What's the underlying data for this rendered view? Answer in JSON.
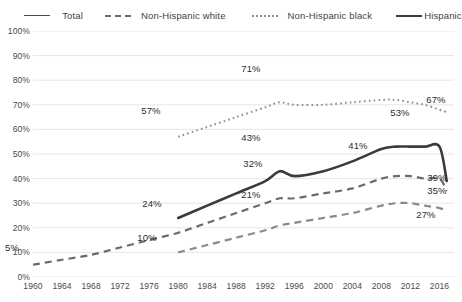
{
  "legend": {
    "items": [
      {
        "label": "Total",
        "style": "solid-thin",
        "icon": "line-solid-thin-icon"
      },
      {
        "label": "Non-Hispanic white",
        "style": "dashed",
        "icon": "line-dashed-icon"
      },
      {
        "label": "Non-Hispanic black",
        "style": "dotted",
        "icon": "line-dotted-icon"
      },
      {
        "label": "Hispanic",
        "style": "solid-thick",
        "icon": "line-solid-thick-icon"
      }
    ]
  },
  "chart_data": {
    "type": "line",
    "title": "",
    "xlabel": "",
    "ylabel": "",
    "xlim": [
      1960,
      2018
    ],
    "ylim": [
      0,
      100
    ],
    "grid": true,
    "legend_position": "top",
    "y_ticks": [
      "0%",
      "10%",
      "20%",
      "30%",
      "40%",
      "50%",
      "60%",
      "70%",
      "80%",
      "90%",
      "100%"
    ],
    "y_tick_values": [
      0,
      10,
      20,
      30,
      40,
      50,
      60,
      70,
      80,
      90,
      100
    ],
    "x_ticks": [
      "1960",
      "1964",
      "1968",
      "1972",
      "1976",
      "1980",
      "1984",
      "1988",
      "1992",
      "1996",
      "2000",
      "2004",
      "2008",
      "2012",
      "2016"
    ],
    "x_tick_values": [
      1960,
      1964,
      1968,
      1972,
      1976,
      1980,
      1984,
      1988,
      1992,
      1996,
      2000,
      2004,
      2008,
      2012,
      2016
    ],
    "series": [
      {
        "name": "Total",
        "style": "dashed",
        "color": "#6a6a6a",
        "x": [
          1960,
          1964,
          1968,
          1972,
          1976,
          1980,
          1984,
          1988,
          1992,
          1994,
          1996,
          2000,
          2004,
          2008,
          2010,
          2012,
          2014,
          2016,
          2017
        ],
        "values": [
          5,
          7,
          9,
          12,
          15,
          18,
          22,
          26,
          30,
          32,
          32,
          34,
          36,
          40,
          41,
          41,
          40,
          40,
          35
        ]
      },
      {
        "name": "Non-Hispanic white",
        "style": "dotted",
        "color": "#8d8d8d",
        "x": [
          1980,
          1984,
          1988,
          1992,
          1994,
          1996,
          2000,
          2004,
          2008,
          2010,
          2012,
          2014,
          2016,
          2017
        ],
        "values": [
          57,
          61,
          65,
          69,
          71,
          70,
          70,
          71,
          72,
          72,
          71,
          70,
          68,
          67
        ]
      },
      {
        "name": "Non-Hispanic black",
        "style": "dashed",
        "color": "#8a8a8a",
        "x": [
          1980,
          1984,
          1988,
          1992,
          1994,
          1996,
          2000,
          2004,
          2008,
          2010,
          2012,
          2014,
          2016,
          2017
        ],
        "values": [
          10,
          13,
          16,
          19,
          21,
          22,
          24,
          26,
          29,
          30,
          30,
          29,
          28,
          27
        ]
      },
      {
        "name": "Hispanic",
        "style": "solid-thick",
        "color": "#3b3b3b",
        "x": [
          1980,
          1984,
          1988,
          1992,
          1994,
          1996,
          2000,
          2004,
          2008,
          2010,
          2012,
          2014,
          2016,
          2017
        ],
        "values": [
          24,
          29,
          34,
          39,
          43,
          41,
          43,
          47,
          52,
          53,
          53,
          53,
          53,
          39
        ]
      }
    ],
    "data_labels": [
      {
        "text": "5%",
        "series": "Total",
        "x": 1960,
        "y": 5,
        "px": 12,
        "py": 247
      },
      {
        "text": "10%",
        "series": "Non-Hispanic black",
        "x": 1980,
        "y": 10,
        "px": 147,
        "py": 237
      },
      {
        "text": "24%",
        "series": "Hispanic",
        "x": 1980,
        "y": 24,
        "px": 152,
        "py": 203
      },
      {
        "text": "57%",
        "series": "Non-Hispanic white",
        "x": 1980,
        "y": 57,
        "px": 151,
        "py": 110
      },
      {
        "text": "71%",
        "series": "Non-Hispanic white",
        "x": 1994,
        "y": 71,
        "px": 251,
        "py": 68
      },
      {
        "text": "43%",
        "series": "Hispanic",
        "x": 1994,
        "y": 43,
        "px": 251,
        "py": 137
      },
      {
        "text": "32%",
        "series": "Total",
        "x": 1995,
        "y": 32,
        "px": 253,
        "py": 163
      },
      {
        "text": "21%",
        "series": "Non-Hispanic black",
        "x": 1995,
        "y": 21,
        "px": 251,
        "py": 194
      },
      {
        "text": "41%",
        "series": "Total",
        "x": 2010,
        "y": 41,
        "px": 358,
        "py": 145
      },
      {
        "text": "53%",
        "series": "Hispanic",
        "x": 2012,
        "y": 53,
        "px": 400,
        "py": 112
      },
      {
        "text": "67%",
        "series": "Non-Hispanic white",
        "x": 2017,
        "y": 67,
        "px": 436,
        "py": 99
      },
      {
        "text": "39%",
        "series": "Hispanic",
        "x": 2017,
        "y": 39,
        "px": 437,
        "py": 177
      },
      {
        "text": "35%",
        "series": "Total",
        "x": 2017,
        "y": 35,
        "px": 437,
        "py": 190
      },
      {
        "text": "27%",
        "series": "Non-Hispanic black",
        "x": 2017,
        "y": 27,
        "px": 426,
        "py": 214
      }
    ]
  }
}
